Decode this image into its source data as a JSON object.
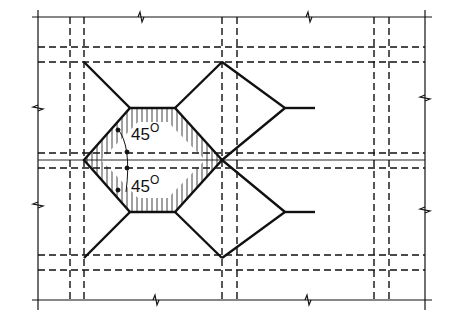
{
  "diagram": {
    "type": "plan-view structural drawing",
    "colors": {
      "ink": "#111111",
      "background": "#ffffff"
    },
    "angles": [
      {
        "label": "45",
        "unit": "O",
        "position": "upper"
      },
      {
        "label": "45",
        "unit": "O",
        "position": "lower"
      }
    ],
    "hatched_region": "octagonal area (left octagon)"
  }
}
